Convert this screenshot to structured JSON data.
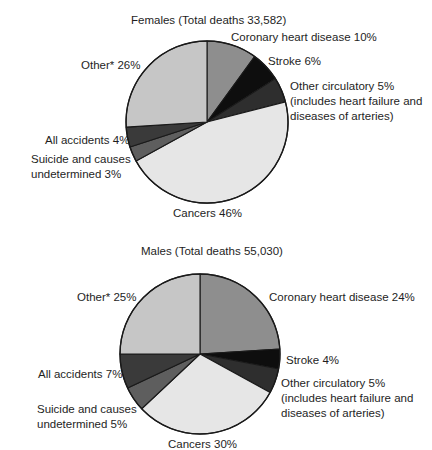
{
  "chart_data": [
    {
      "type": "pie",
      "title": "Females (Total deaths 33,582)",
      "total_deaths": 33582,
      "categories": [
        "Coronary heart disease",
        "Stroke",
        "Other circulatory (includes heart failure and diseases of arteries)",
        "Cancers",
        "Suicide and causes undetermined",
        "All accidents",
        "Other*"
      ],
      "values": [
        10,
        6,
        5,
        46,
        3,
        4,
        26
      ],
      "unit": "%"
    },
    {
      "type": "pie",
      "title": "Males (Total deaths 55,030)",
      "total_deaths": 55030,
      "categories": [
        "Coronary heart disease",
        "Stroke",
        "Other circulatory (includes heart failure and diseases of arteries)",
        "Cancers",
        "Suicide and causes undetermined",
        "All accidents",
        "Other*"
      ],
      "values": [
        24,
        4,
        5,
        30,
        5,
        7,
        25
      ],
      "unit": "%"
    }
  ],
  "colors": [
    "#8e8e8e",
    "#0e0e0e",
    "#2e2e2e",
    "#e6e6e6",
    "#5e5e5e",
    "#3a3a3a",
    "#c6c6c6"
  ],
  "females": {
    "title": "Females (Total deaths 33,582)",
    "labels": {
      "coronary": "Coronary heart disease 10%",
      "stroke": "Stroke 6%",
      "other_circ_1": "Other circulatory 5%",
      "other_circ_2": "(includes heart failure and",
      "other_circ_3": "diseases of arteries)",
      "cancers": "Cancers 46%",
      "suicide_1": "Suicide and causes",
      "suicide_2": "undetermined 3%",
      "accidents": "All accidents 4%",
      "other": "Other* 26%"
    }
  },
  "males": {
    "title": "Males (Total deaths 55,030)",
    "labels": {
      "coronary": "Coronary heart disease 24%",
      "stroke": "Stroke 4%",
      "other_circ_1": "Other circulatory 5%",
      "other_circ_2": "(includes heart failure and",
      "other_circ_3": "diseases of arteries)",
      "cancers": "Cancers 30%",
      "suicide_1": "Suicide and causes",
      "suicide_2": "undetermined 5%",
      "accidents": "All accidents 7%",
      "other": "Other* 25%"
    }
  }
}
